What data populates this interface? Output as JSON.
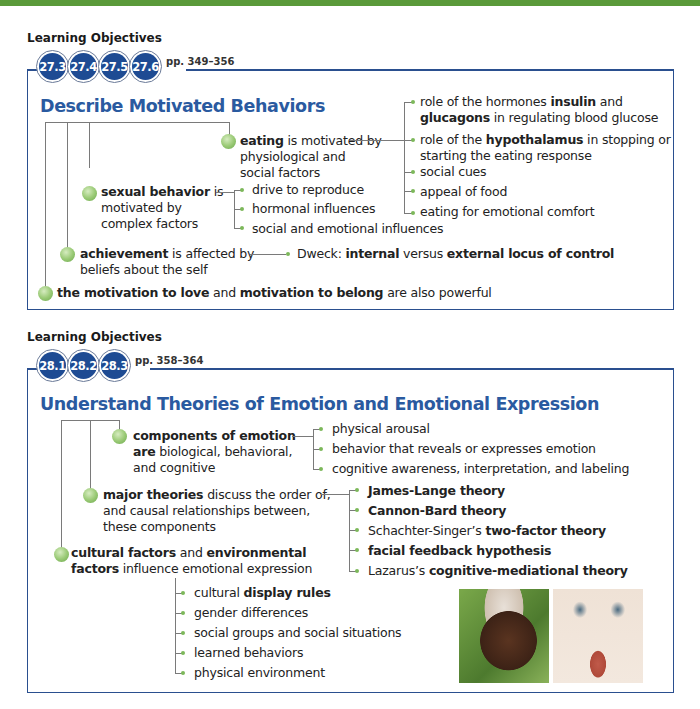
{
  "section1": {
    "lo_label": "Learning Objectives",
    "badges": [
      "27.3",
      "27.4",
      "27.5",
      "27.6"
    ],
    "pages": "pp. 349–356",
    "heading": "Describe Motivated Behaviors",
    "eating": {
      "bold": "eating",
      "rest1": " is motivated by",
      "line2": "physiological and",
      "line3": "social factors",
      "children": [
        {
          "pre": "role of the hormones ",
          "bold": "insulin",
          "post": " and"
        },
        {
          "pre": "",
          "bold": "glucagons",
          "post": " in regulating blood glucose"
        },
        {
          "pre": "role of the ",
          "bold": "hypothalamus",
          "post": " in stopping or"
        },
        {
          "pre": "starting the eating response",
          "bold": "",
          "post": ""
        },
        {
          "pre": "social cues",
          "bold": "",
          "post": ""
        },
        {
          "pre": "appeal of food",
          "bold": "",
          "post": ""
        },
        {
          "pre": "eating for emotional comfort",
          "bold": "",
          "post": ""
        }
      ]
    },
    "sexual": {
      "bold": "sexual behavior",
      "rest1": " is",
      "line2": "motivated by",
      "line3": "complex factors",
      "children": [
        "drive to reproduce",
        "hormonal influences",
        "social and emotional influences"
      ]
    },
    "achievement": {
      "bold": "achievement",
      "rest1": " is affected by",
      "line2": "beliefs about the self",
      "child_pre": "Dweck: ",
      "child_bold1": "internal",
      "child_mid": " versus ",
      "child_bold2": "external locus of control"
    },
    "love": {
      "bold1": "the motivation to love",
      "mid": " and ",
      "bold2": "motivation to belong",
      "post": " are also powerful"
    }
  },
  "section2": {
    "lo_label": "Learning Objectives",
    "badges": [
      "28.1",
      "28.2",
      "28.3"
    ],
    "pages": "pp. 358–364",
    "heading": "Understand Theories of Emotion and Emotional Expression",
    "components": {
      "bold1": "components of emotion",
      "bold2": "are",
      "rest2": " biological, behavioral,",
      "line3": "and cognitive",
      "children": [
        "physical arousal",
        "behavior that reveals or expresses emotion",
        "cognitive awareness, interpretation, and labeling"
      ]
    },
    "theories": {
      "bold": "major theories",
      "rest1": " discuss the order of,",
      "line2": "and causal relationships between,",
      "line3": "these components",
      "children": [
        {
          "pre": "",
          "bold": "James-Lange theory"
        },
        {
          "pre": "",
          "bold": "Cannon-Bard theory"
        },
        {
          "pre": "Schachter-Singer’s ",
          "bold": "two-factor theory"
        },
        {
          "pre": "",
          "bold": "facial feedback hypothesis"
        },
        {
          "pre": "Lazarus’s ",
          "bold": "cognitive-mediational theory"
        }
      ]
    },
    "cultural": {
      "bold1": "cultural factors",
      "mid": " and ",
      "bold2": "environmental",
      "bold3": "factors",
      "rest2": " influence emotional expression",
      "children": [
        {
          "pre": "cultural ",
          "bold": "display rules"
        },
        {
          "pre": "gender differences",
          "bold": ""
        },
        {
          "pre": "social groups and social situations",
          "bold": ""
        },
        {
          "pre": "learned behaviors",
          "bold": ""
        },
        {
          "pre": "physical environment",
          "bold": ""
        }
      ]
    },
    "photos": [
      "photo-smiling-woman-headdress",
      "photo-disgusted-face"
    ]
  }
}
